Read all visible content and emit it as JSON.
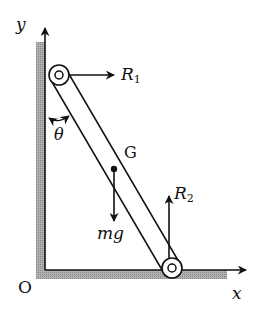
{
  "diagram": {
    "type": "ladder-against-wall-free-body-diagram",
    "axes": {
      "y_label": "y",
      "x_label": "x",
      "origin_label": "O"
    },
    "body": {
      "center_of_mass_label": "G",
      "angle_label": "θ"
    },
    "forces": [
      {
        "name": "R1",
        "symbol": "R",
        "subscript": "1",
        "direction": "right",
        "applied_at": "top pin (wall contact)"
      },
      {
        "name": "R2",
        "symbol": "R",
        "subscript": "2",
        "direction": "up",
        "applied_at": "bottom pin (floor contact)"
      },
      {
        "name": "mg",
        "symbol": "mg",
        "direction": "down",
        "applied_at": "G"
      }
    ],
    "colors": {
      "ink": "#111111",
      "hatch": "#9a9a9a",
      "background": "#ffffff"
    }
  }
}
